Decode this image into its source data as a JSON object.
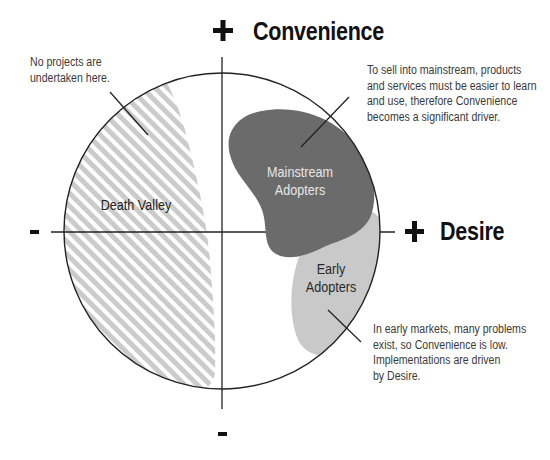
{
  "diagram": {
    "axes": {
      "vertical": {
        "positive_sign": "+",
        "positive_label": "Convenience",
        "negative_sign": "-"
      },
      "horizontal": {
        "positive_sign": "+",
        "positive_label": "Desire",
        "negative_sign": "-"
      }
    },
    "regions": {
      "death_valley": {
        "label": "Death Valley",
        "pattern": "diagonal-hatch",
        "stripe_color": "#cbcbcb"
      },
      "mainstream_adopters": {
        "line1": "Mainstream",
        "line2": "Adopters",
        "fill": "#6b6b6b",
        "text_color": "#e6e6e6"
      },
      "early_adopters": {
        "line1": "Early",
        "line2": "Adopters",
        "fill": "#c9c9c9",
        "text_color": "#2a2a2a"
      }
    },
    "annotations": {
      "death_valley_note": {
        "lines": [
          "No projects are",
          "undertaken here."
        ]
      },
      "mainstream_note": {
        "lines": [
          "To sell into mainstream, products",
          "and services must be easier to learn",
          "and use, therefore Convenience",
          "becomes a significant driver."
        ]
      },
      "early_note": {
        "lines": [
          "In early markets, many problems",
          "exist, so Convenience is low.",
          "Implementations are driven",
          "by Desire."
        ]
      }
    },
    "colors": {
      "outline": "#222222",
      "axis": "#222222",
      "text": "#111111",
      "note_text": "#3a3a3a"
    }
  }
}
